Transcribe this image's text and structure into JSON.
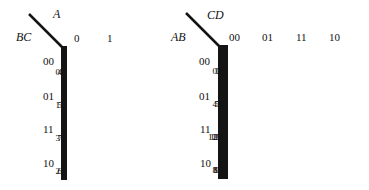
{
  "maps": [
    {
      "name": "three-variable",
      "col_var": "A",
      "row_var": "BC",
      "col_labels": [
        "0",
        "1"
      ],
      "row_labels": [
        "00",
        "01",
        "11",
        "10"
      ],
      "cells": [
        [
          "0",
          "4"
        ],
        [
          "1",
          "5"
        ],
        [
          "3",
          "7"
        ],
        [
          "2",
          "6"
        ]
      ]
    },
    {
      "name": "four-variable",
      "col_var": "CD",
      "row_var": "AB",
      "col_labels": [
        "00",
        "01",
        "11",
        "10"
      ],
      "row_labels": [
        "00",
        "01",
        "11",
        "10"
      ],
      "cells": [
        [
          "0",
          "1",
          "3",
          "2"
        ],
        [
          "4",
          "5",
          "7",
          "6"
        ],
        [
          "12",
          "13",
          "15",
          "14"
        ],
        [
          "8",
          "9",
          "11",
          "10"
        ]
      ]
    }
  ]
}
